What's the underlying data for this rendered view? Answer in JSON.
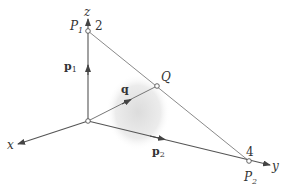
{
  "diagram": {
    "axes": {
      "x_label": "x",
      "y_label": "y",
      "z_label": "z"
    },
    "points": {
      "P1": {
        "label": "P",
        "sub": "1",
        "weight": "2"
      },
      "P2": {
        "label": "P",
        "sub": "2",
        "weight": "4"
      },
      "Q": {
        "label": "Q"
      }
    },
    "vectors": {
      "p1": {
        "label": "p",
        "sub": "1"
      },
      "p2": {
        "label": "p",
        "sub": "2"
      },
      "q": {
        "label": "q"
      }
    },
    "colors": {
      "axis": "#555555",
      "segment": "#888888",
      "shade": "#e6e6e6"
    }
  }
}
